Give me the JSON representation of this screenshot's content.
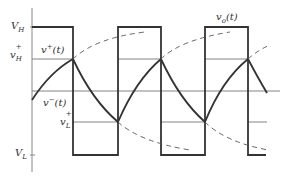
{
  "diagram": {
    "labels": {
      "vh": "V",
      "vh_sub": "H",
      "vhp": "v",
      "vhp_sup": "+",
      "vhp_sub": "H",
      "vplus": "v",
      "vplus_sup": "+",
      "vplus_arg": "(t)",
      "vminus": "v",
      "vminus_sup": "−",
      "vminus_arg": "(t)",
      "vlp": "v",
      "vlp_sup": "+",
      "vlp_sub": "L",
      "vl": "V",
      "vl_sub": "L",
      "vo": "v",
      "vo_sub": "o",
      "vo_arg": "(t)"
    },
    "levels": {
      "V_H": 27,
      "v_H_plus": 59,
      "zero": 91,
      "v_L_plus": 122,
      "V_L": 155
    },
    "square_wave_transitions_x": [
      73,
      118,
      161,
      205
    ],
    "colors": {
      "axis": "#888888",
      "wave": "#333333",
      "dashed": "#555555",
      "ref": "#777777"
    }
  }
}
